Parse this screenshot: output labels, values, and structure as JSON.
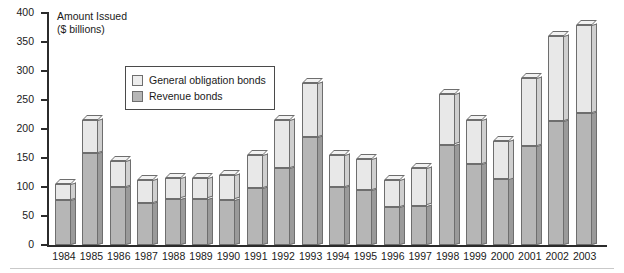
{
  "axis_title": {
    "line1": "Amount Issued",
    "line2": "($ billions)"
  },
  "legend": {
    "items": [
      {
        "label": "General obligation bonds",
        "color": "#ededed",
        "key": "general_obligation"
      },
      {
        "label": "Revenue bonds",
        "color": "#b6b6b6",
        "key": "revenue"
      }
    ]
  },
  "chart_data": {
    "type": "bar",
    "subtype": "stacked",
    "title": "Amount Issued ($ billions)",
    "xlabel": "",
    "ylabel": "Amount Issued ($ billions)",
    "ylim": [
      0,
      400
    ],
    "ytick_step": 50,
    "yticks": [
      0,
      50,
      100,
      150,
      200,
      250,
      300,
      350,
      400
    ],
    "grid": false,
    "legend_position": "inside-upper-left",
    "categories": [
      "1984",
      "1985",
      "1986",
      "1987",
      "1988",
      "1989",
      "1990",
      "1991",
      "1992",
      "1993",
      "1994",
      "1995",
      "1996",
      "1997",
      "1998",
      "1999",
      "2000",
      "2001",
      "2002",
      "2003"
    ],
    "series": [
      {
        "name": "Revenue bonds",
        "color": "#b6b6b6",
        "values": [
          78,
          158,
          100,
          72,
          80,
          80,
          78,
          98,
          133,
          187,
          100,
          95,
          65,
          68,
          173,
          140,
          113,
          170,
          213,
          228
        ]
      },
      {
        "name": "General obligation bonds",
        "color": "#ededed",
        "values": [
          27,
          57,
          45,
          40,
          35,
          35,
          42,
          57,
          82,
          93,
          55,
          53,
          47,
          64,
          87,
          75,
          67,
          118,
          147,
          152
        ]
      }
    ],
    "totals": [
      105,
      215,
      145,
      112,
      115,
      115,
      120,
      155,
      215,
      280,
      155,
      148,
      112,
      132,
      260,
      215,
      180,
      288,
      360,
      380
    ]
  }
}
